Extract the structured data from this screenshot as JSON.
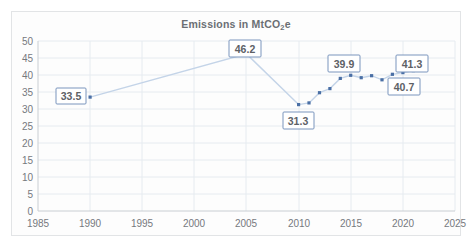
{
  "chart_data": {
    "type": "line",
    "title": "Emissions in MtCO2e",
    "title_prefix": "Emissions in MtCO",
    "title_sub": "2",
    "title_suffix": "e",
    "xlabel": "",
    "ylabel": "",
    "xlim": [
      1985,
      2025
    ],
    "ylim": [
      0,
      50
    ],
    "grid": true,
    "legend": "none",
    "x_ticks": [
      "1985",
      "1990",
      "1995",
      "2000",
      "2005",
      "2010",
      "2015",
      "2020",
      "2025"
    ],
    "y_ticks": [
      "0",
      "5",
      "10",
      "15",
      "20",
      "25",
      "30",
      "35",
      "40",
      "45",
      "50"
    ],
    "x": [
      1990,
      2005,
      2010,
      2011,
      2012,
      2013,
      2014,
      2015,
      2016,
      2017,
      2018,
      2019,
      2020,
      2021
    ],
    "values": [
      33.5,
      46.2,
      31.3,
      31.8,
      34.8,
      36.0,
      39.0,
      39.9,
      39.2,
      39.8,
      38.6,
      40.2,
      40.7,
      41.3
    ],
    "point_labels": [
      {
        "name": "label-1990",
        "text": "33.5",
        "x": 1990,
        "y": 33.5
      },
      {
        "name": "label-2005",
        "text": "46.2",
        "x": 2005,
        "y": 46.2
      },
      {
        "name": "label-2010",
        "text": "31.3",
        "x": 2010,
        "y": 31.3
      },
      {
        "name": "label-2015",
        "text": "39.9",
        "x": 2015,
        "y": 39.9
      },
      {
        "name": "label-2020",
        "text": "40.7",
        "x": 2020,
        "y": 40.7
      },
      {
        "name": "label-2021",
        "text": "41.3",
        "x": 2021,
        "y": 41.3
      }
    ],
    "colors": {
      "line": "#c4d4e8",
      "marker": "#4a6fa5",
      "grid": "#e6ebf0",
      "axis": "#c9ced3",
      "tick_text": "#76797d",
      "title_text": "#6b6f74",
      "label_border": "#7a95bd",
      "label_text": "#5d6166",
      "card_background": "#fdfdfd",
      "card_border": "#e2e4e6"
    }
  },
  "labels": {
    "l0": "33.5",
    "l1": "46.2",
    "l2": "31.3",
    "l3": "39.9",
    "l4": "40.7",
    "l5": "41.3"
  },
  "yticks": {
    "t0": "50",
    "t1": "45",
    "t2": "40",
    "t3": "35",
    "t4": "30",
    "t5": "25",
    "t6": "20",
    "t7": "15",
    "t8": "10",
    "t9": "5",
    "t10": "0"
  },
  "xticks": {
    "t0": "1985",
    "t1": "1990",
    "t2": "1995",
    "t3": "2000",
    "t4": "2005",
    "t5": "2010",
    "t6": "2015",
    "t7": "2020",
    "t8": "2025"
  },
  "title": {
    "prefix": "Emissions in MtCO",
    "sub": "2",
    "suffix": "e"
  }
}
